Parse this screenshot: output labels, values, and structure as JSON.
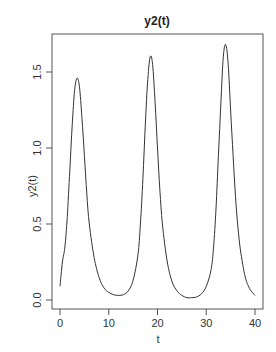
{
  "chart_data": {
    "type": "line",
    "title": "y2(t)",
    "xlabel": "t",
    "ylabel": "y2(t)",
    "xlim": [
      0,
      40
    ],
    "ylim": [
      0,
      1.7
    ],
    "x_ticks": [
      0,
      10,
      20,
      30,
      40
    ],
    "x_tick_labels": [
      "0",
      "10",
      "20",
      "30",
      "40"
    ],
    "y_ticks": [
      0.0,
      0.5,
      1.0,
      1.5
    ],
    "y_tick_labels": [
      "0.0",
      "0.5",
      "1.0",
      "1.5"
    ],
    "grid": false,
    "legend": null,
    "series": [
      {
        "name": "y2(t)",
        "color": "#333333",
        "x": [
          0,
          0.5,
          1,
          1.5,
          2,
          2.5,
          3,
          3.5,
          4,
          4.5,
          5,
          5.5,
          6,
          7,
          8,
          9,
          10,
          11,
          12,
          13,
          14,
          15,
          16,
          16.5,
          17,
          17.5,
          18,
          18.5,
          19,
          19.5,
          20,
          20.5,
          21,
          22,
          23,
          24,
          25,
          26,
          27,
          28,
          29,
          30,
          31,
          31.5,
          32,
          32.5,
          33,
          33.5,
          34,
          34.5,
          35,
          35.5,
          36,
          36.5,
          37,
          38,
          39,
          40
        ],
        "y": [
          0.09,
          0.25,
          0.35,
          0.55,
          0.85,
          1.15,
          1.38,
          1.46,
          1.4,
          1.2,
          0.95,
          0.7,
          0.5,
          0.28,
          0.15,
          0.08,
          0.05,
          0.035,
          0.03,
          0.035,
          0.06,
          0.13,
          0.3,
          0.5,
          0.8,
          1.15,
          1.45,
          1.6,
          1.55,
          1.3,
          1.0,
          0.72,
          0.5,
          0.25,
          0.12,
          0.06,
          0.03,
          0.015,
          0.015,
          0.02,
          0.04,
          0.09,
          0.2,
          0.35,
          0.6,
          0.95,
          1.3,
          1.6,
          1.68,
          1.55,
          1.25,
          0.95,
          0.68,
          0.48,
          0.33,
          0.15,
          0.07,
          0.03
        ]
      }
    ]
  }
}
